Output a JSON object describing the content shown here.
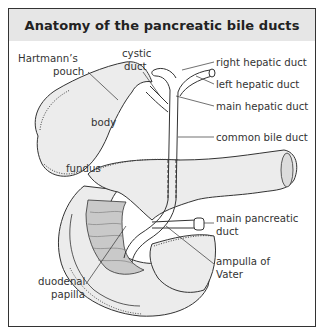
{
  "title": "Anatomy of the pancreatic bile ducts",
  "colors": {
    "title_bg": "#e6e6e6",
    "border": "#333333",
    "organ_fill": "#ececec",
    "mucosa_fill": "#c9c9c9",
    "line": "#333333"
  },
  "labels": {
    "hartmanns_pouch_1": "Hartmann’s",
    "hartmanns_pouch_2": "pouch",
    "cystic_duct_1": "cystic",
    "cystic_duct_2": "duct",
    "body": "body",
    "fundus": "fundus",
    "right_hepatic_duct": "right hepatic duct",
    "left_hepatic_duct": "left hepatic duct",
    "main_hepatic_duct": "main hepatic duct",
    "common_bile_duct": "common bile duct",
    "main_pancreatic_duct_1": "main pancreatic",
    "main_pancreatic_duct_2": "duct",
    "ampulla_of_vater_1": "ampulla of",
    "ampulla_of_vater_2": "Vater",
    "duodenal_papilla_1": "duodenal",
    "duodenal_papilla_2": "papilla"
  }
}
